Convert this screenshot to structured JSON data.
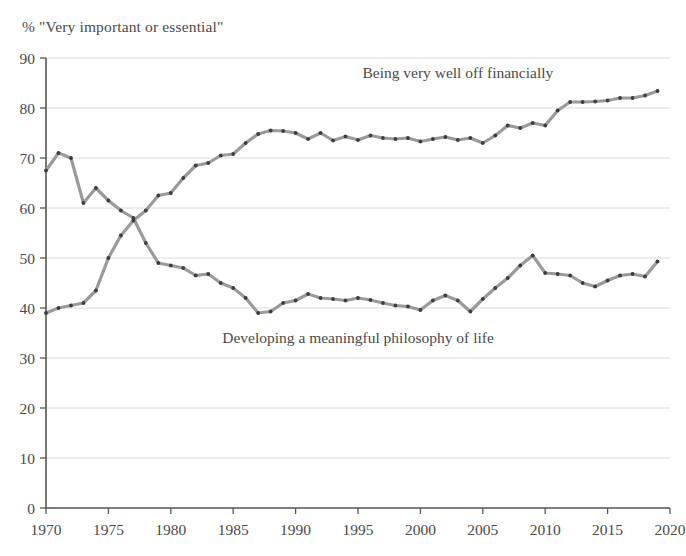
{
  "chart_data": {
    "type": "line",
    "title": "% \"Very important or essential\"",
    "xlabel": "",
    "ylabel": "",
    "xlim": [
      1970,
      2020
    ],
    "ylim": [
      0,
      90
    ],
    "ytick_step": 10,
    "xtick_step": 5,
    "grid": true,
    "grid_axis": "y",
    "legend_position": "inline-annotation",
    "yticks": [
      0,
      10,
      20,
      30,
      40,
      50,
      60,
      70,
      80,
      90
    ],
    "xticks": [
      1970,
      1975,
      1980,
      1985,
      1990,
      1995,
      2000,
      2005,
      2010,
      2015,
      2020
    ],
    "series": [
      {
        "name": "Being very well off financially",
        "color": "#9a9a9a",
        "marker_color": "#3d3d3d",
        "label_x": 2003,
        "label_y": 86,
        "x": [
          1970,
          1971,
          1972,
          1973,
          1974,
          1975,
          1976,
          1977,
          1978,
          1979,
          1980,
          1981,
          1982,
          1983,
          1984,
          1985,
          1986,
          1987,
          1988,
          1989,
          1990,
          1991,
          1992,
          1993,
          1994,
          1995,
          1996,
          1997,
          1998,
          1999,
          2000,
          2001,
          2002,
          2003,
          2004,
          2005,
          2006,
          2007,
          2008,
          2009,
          2010,
          2011,
          2012,
          2013,
          2014,
          2015,
          2016,
          2017,
          2018,
          2019
        ],
        "y": [
          39.0,
          40.0,
          40.5,
          41.0,
          43.5,
          50.0,
          54.5,
          57.5,
          59.5,
          62.5,
          63.0,
          66.0,
          68.5,
          69.0,
          70.5,
          70.8,
          73.0,
          74.8,
          75.5,
          75.4,
          75.0,
          73.8,
          75.0,
          73.5,
          74.3,
          73.6,
          74.5,
          74.0,
          73.8,
          74.0,
          73.3,
          73.8,
          74.2,
          73.6,
          74.0,
          73.0,
          74.5,
          76.5,
          76.0,
          77.0,
          76.5,
          79.5,
          81.2,
          81.2,
          81.3,
          81.5,
          82.0,
          82.0,
          82.5,
          83.4
        ]
      },
      {
        "name": "Developing a meaningful philosophy of life",
        "color": "#9a9a9a",
        "marker_color": "#3d3d3d",
        "label_x": 1995,
        "label_y": 33,
        "x": [
          1970,
          1971,
          1972,
          1973,
          1974,
          1975,
          1976,
          1977,
          1978,
          1979,
          1980,
          1981,
          1982,
          1983,
          1984,
          1985,
          1986,
          1987,
          1988,
          1989,
          1990,
          1991,
          1992,
          1993,
          1994,
          1995,
          1996,
          1997,
          1998,
          1999,
          2000,
          2001,
          2002,
          2003,
          2004,
          2005,
          2006,
          2007,
          2008,
          2009,
          2010,
          2011,
          2012,
          2013,
          2014,
          2015,
          2016,
          2017,
          2018,
          2019
        ],
        "y": [
          67.5,
          71.0,
          70.0,
          61.0,
          64.0,
          61.5,
          59.5,
          58.0,
          53.0,
          49.0,
          48.5,
          48.0,
          46.5,
          46.8,
          45.0,
          44.0,
          42.0,
          39.0,
          39.3,
          41.0,
          41.5,
          42.8,
          42.0,
          41.8,
          41.5,
          42.0,
          41.6,
          41.0,
          40.5,
          40.3,
          39.6,
          41.5,
          42.5,
          41.5,
          39.3,
          41.8,
          44.0,
          46.0,
          48.5,
          50.5,
          47.0,
          46.8,
          46.5,
          45.0,
          44.3,
          45.5,
          46.5,
          46.8,
          46.3,
          49.3
        ]
      }
    ]
  },
  "labels": {
    "title": "% \"Very important or essential\"",
    "series_one": "Being very well off financially",
    "series_two": "Developing a meaningful philosophy of life"
  }
}
